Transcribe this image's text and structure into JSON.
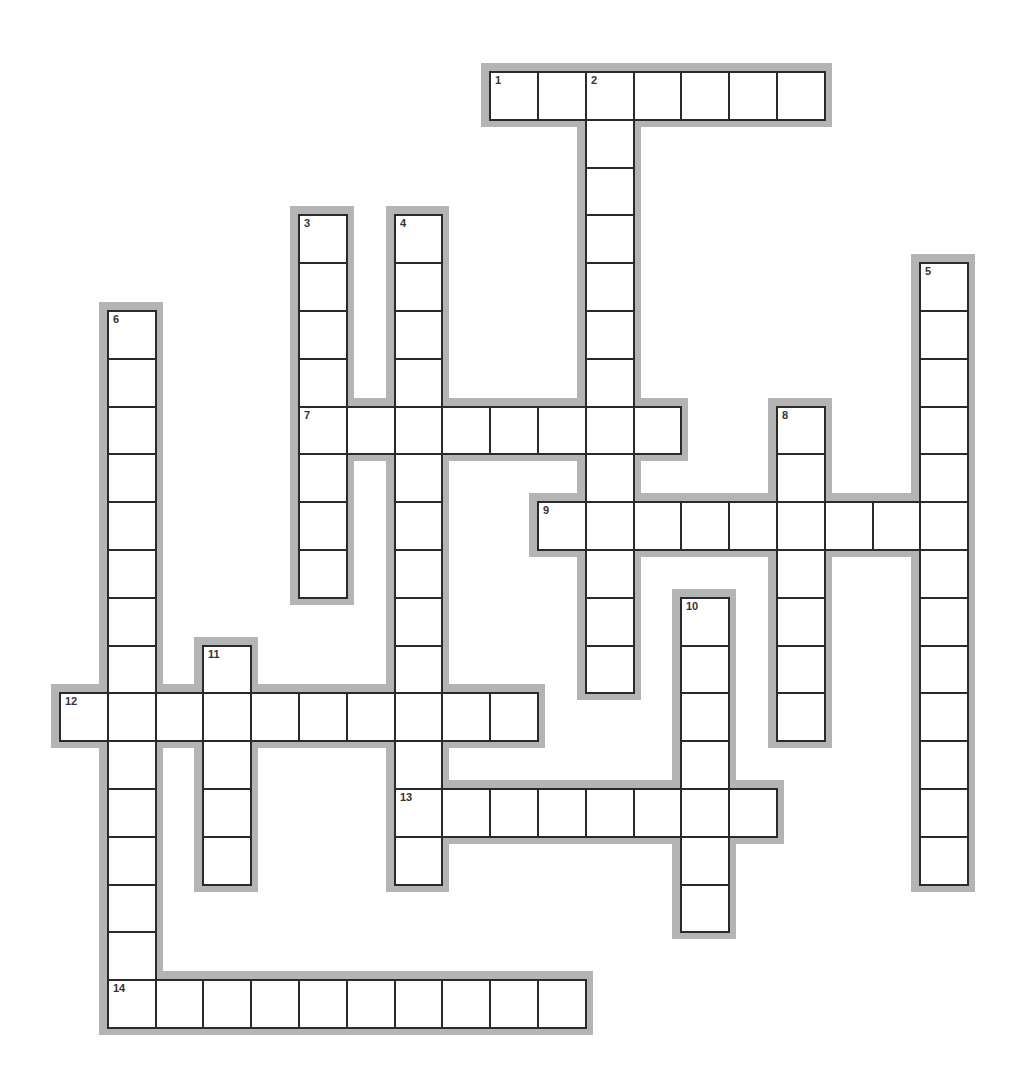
{
  "puzzle": {
    "grid": {
      "origin_x": 59,
      "origin_y": 71,
      "cell_size": 47.8,
      "border_color": "#2a2a2a",
      "shadow_color": "#b4b4b4"
    },
    "words": [
      {
        "number": "1",
        "direction": "across",
        "row": 0,
        "col": 9,
        "length": 7
      },
      {
        "number": "2",
        "direction": "down",
        "row": 0,
        "col": 11,
        "length": 13
      },
      {
        "number": "3",
        "direction": "down",
        "row": 3,
        "col": 5,
        "length": 8
      },
      {
        "number": "4",
        "direction": "down",
        "row": 3,
        "col": 7,
        "length": 14
      },
      {
        "number": "5",
        "direction": "down",
        "row": 4,
        "col": 18,
        "length": 13
      },
      {
        "number": "6",
        "direction": "down",
        "row": 5,
        "col": 1,
        "length": 15
      },
      {
        "number": "7",
        "direction": "across",
        "row": 7,
        "col": 5,
        "length": 8
      },
      {
        "number": "8",
        "direction": "down",
        "row": 7,
        "col": 15,
        "length": 7
      },
      {
        "number": "9",
        "direction": "across",
        "row": 9,
        "col": 10,
        "length": 9
      },
      {
        "number": "10",
        "direction": "down",
        "row": 11,
        "col": 13,
        "length": 7
      },
      {
        "number": "11",
        "direction": "down",
        "row": 12,
        "col": 3,
        "length": 5
      },
      {
        "number": "12",
        "direction": "across",
        "row": 13,
        "col": 0,
        "length": 10
      },
      {
        "number": "13",
        "direction": "across",
        "row": 15,
        "col": 7,
        "length": 8
      },
      {
        "number": "14",
        "direction": "across",
        "row": 19,
        "col": 1,
        "length": 10
      }
    ]
  }
}
